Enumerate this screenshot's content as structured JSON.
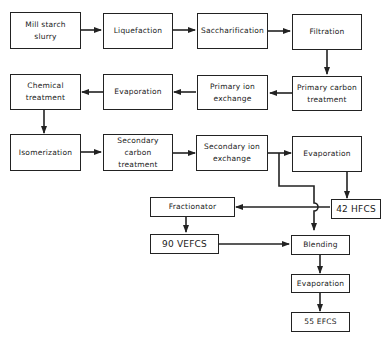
{
  "diagram": {
    "type": "process-flow",
    "nodes": [
      {
        "id": "mill",
        "label": "Mill starch\nslurry"
      },
      {
        "id": "liq",
        "label": "Liquefaction"
      },
      {
        "id": "sacc",
        "label": "Saccharification"
      },
      {
        "id": "filt",
        "label": "Filtration"
      },
      {
        "id": "pct",
        "label": "Primary carbon\ntreatment"
      },
      {
        "id": "pie",
        "label": "Primary ion\nexchange"
      },
      {
        "id": "evap1",
        "label": "Evaporation"
      },
      {
        "id": "chem",
        "label": "Chemical\ntreatment"
      },
      {
        "id": "isom",
        "label": "Isomerization"
      },
      {
        "id": "sct",
        "label": "Secondary\ncarbon\ntreatment"
      },
      {
        "id": "sie",
        "label": "Secondary ion\nexchange"
      },
      {
        "id": "evap2",
        "label": "Evaporation"
      },
      {
        "id": "hfcs42",
        "label": "42 HFCS"
      },
      {
        "id": "frac",
        "label": "Fractionator"
      },
      {
        "id": "vefcs90",
        "label": "90 VEFCS"
      },
      {
        "id": "blend",
        "label": "Blending"
      },
      {
        "id": "evap3",
        "label": "Evaporation"
      },
      {
        "id": "efcs55",
        "label": "55 EFCS"
      }
    ],
    "edges": [
      [
        "mill",
        "liq"
      ],
      [
        "liq",
        "sacc"
      ],
      [
        "sacc",
        "filt"
      ],
      [
        "filt",
        "pct"
      ],
      [
        "pct",
        "pie"
      ],
      [
        "pie",
        "evap1"
      ],
      [
        "evap1",
        "chem"
      ],
      [
        "chem",
        "isom"
      ],
      [
        "isom",
        "sct"
      ],
      [
        "sct",
        "sie"
      ],
      [
        "sie",
        "evap2"
      ],
      [
        "evap2",
        "hfcs42"
      ],
      [
        "sie",
        "blend"
      ],
      [
        "hfcs42",
        "frac"
      ],
      [
        "frac",
        "vefcs90"
      ],
      [
        "vefcs90",
        "blend"
      ],
      [
        "blend",
        "evap3"
      ],
      [
        "evap3",
        "efcs55"
      ]
    ]
  }
}
